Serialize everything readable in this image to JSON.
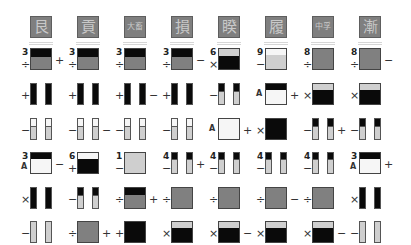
{
  "colors": {
    "background": "#ffffff",
    "tile": "#7f7f7f",
    "tile_glyph": "#c9c9c9",
    "black": "#0a0a0a",
    "gray": "#808080",
    "light": "#cfcfcf",
    "white": "#f6f6f6"
  },
  "columns_x": [
    30,
    77,
    124,
    171,
    218,
    265,
    312,
    359
  ],
  "rows_y": [
    48,
    83,
    118,
    152,
    187,
    221
  ],
  "headers": [
    "艮",
    "貢",
    "大畜",
    "損",
    "睽",
    "履",
    "中孚",
    "漸"
  ],
  "grid": [
    [
      {
        "type": "square",
        "top": "black",
        "topH": 8,
        "body": "gray",
        "num": "3",
        "pre": "÷",
        "post": "+"
      },
      {
        "type": "square",
        "top": "black",
        "topH": 8,
        "body": "gray",
        "num": "3",
        "pre": "÷",
        "post": ""
      },
      {
        "type": "square",
        "top": "black",
        "topH": 8,
        "body": "gray",
        "num": "3",
        "pre": "÷",
        "post": ""
      },
      {
        "type": "square",
        "top": "black",
        "topH": 8,
        "body": "gray",
        "num": "3",
        "pre": "÷",
        "post": "−"
      },
      {
        "type": "square",
        "top": "light",
        "topH": 7,
        "body": "black",
        "num": "6",
        "pre": "×",
        "post": ""
      },
      {
        "type": "square",
        "top": "white",
        "topH": 6,
        "body": "light",
        "num": "9",
        "pre": "−",
        "post": ""
      },
      {
        "type": "square",
        "top": "",
        "topH": 0,
        "body": "gray",
        "num": "8",
        "pre": "÷",
        "post": ""
      },
      {
        "type": "square",
        "top": "",
        "topH": 0,
        "body": "gray",
        "num": "8",
        "pre": "÷",
        "post": "−"
      }
    ],
    [
      {
        "type": "pills",
        "seg": "black",
        "segH": 22,
        "body": "black",
        "num": "",
        "pre": "+",
        "post": ""
      },
      {
        "type": "pills",
        "seg": "black",
        "segH": 22,
        "body": "black",
        "num": "",
        "pre": "+",
        "post": ""
      },
      {
        "type": "pills",
        "seg": "black",
        "segH": 22,
        "body": "black",
        "num": "",
        "pre": "+",
        "post": "−"
      },
      {
        "type": "pills",
        "seg": "black",
        "segH": 22,
        "body": "black",
        "num": "",
        "pre": "+",
        "post": ""
      },
      {
        "type": "pills",
        "seg": "black",
        "segH": 7,
        "body": "light",
        "num": "",
        "pre": "−",
        "post": ""
      },
      {
        "type": "square",
        "top": "black",
        "topH": 6,
        "body": "white",
        "num": "",
        "pre": "A",
        "post": "+"
      },
      {
        "type": "square",
        "top": "light",
        "topH": 6,
        "body": "black",
        "num": "",
        "pre": "×",
        "post": ""
      },
      {
        "type": "square",
        "top": "light",
        "topH": 6,
        "body": "black",
        "num": "",
        "pre": "×",
        "post": ""
      }
    ],
    [
      {
        "type": "pills",
        "seg": "white",
        "segH": 7,
        "body": "light",
        "num": "",
        "pre": "−",
        "post": ""
      },
      {
        "type": "pills",
        "seg": "white",
        "segH": 7,
        "body": "light",
        "num": "",
        "pre": "−",
        "post": "−"
      },
      {
        "type": "pills",
        "seg": "white",
        "segH": 7,
        "body": "light",
        "num": "",
        "pre": "−",
        "post": ""
      },
      {
        "type": "pills",
        "seg": "white",
        "segH": 7,
        "body": "light",
        "num": "",
        "pre": "−",
        "post": ""
      },
      {
        "type": "square",
        "top": "",
        "topH": 0,
        "body": "white",
        "num": "",
        "pre": "A",
        "post": "+"
      },
      {
        "type": "square",
        "top": "",
        "topH": 0,
        "body": "black",
        "num": "",
        "pre": "×",
        "post": ""
      },
      {
        "type": "pills",
        "seg": "black",
        "segH": 7,
        "body": "light",
        "num": "",
        "pre": "−",
        "post": "+"
      },
      {
        "type": "pills",
        "seg": "black",
        "segH": 7,
        "body": "light",
        "num": "",
        "pre": "−",
        "post": ""
      }
    ],
    [
      {
        "type": "square",
        "top": "black",
        "topH": 6,
        "body": "white",
        "num": "3",
        "pre": "A",
        "post": "−"
      },
      {
        "type": "square",
        "top": "white",
        "topH": 6,
        "body": "black",
        "num": "6",
        "pre": "+",
        "post": ""
      },
      {
        "type": "square",
        "top": "",
        "topH": 0,
        "body": "light",
        "num": "1",
        "pre": "−",
        "post": ""
      },
      {
        "type": "pills",
        "seg": "black",
        "segH": 6,
        "body": "light",
        "num": "4",
        "pre": "−",
        "post": "+"
      },
      {
        "type": "pills",
        "seg": "black",
        "segH": 6,
        "body": "light",
        "num": "4",
        "pre": "−",
        "post": ""
      },
      {
        "type": "pills",
        "seg": "black",
        "segH": 6,
        "body": "light",
        "num": "4",
        "pre": "−",
        "post": ""
      },
      {
        "type": "pills",
        "seg": "black",
        "segH": 6,
        "body": "light",
        "num": "4",
        "pre": "−",
        "post": ""
      },
      {
        "type": "square",
        "top": "black",
        "topH": 6,
        "body": "white",
        "num": "3",
        "pre": "A",
        "post": "+"
      }
    ],
    [
      {
        "type": "pills",
        "seg": "black",
        "segH": 22,
        "body": "black",
        "num": "",
        "pre": "×",
        "post": ""
      },
      {
        "type": "pills",
        "seg": "black",
        "segH": 7,
        "body": "light",
        "num": "",
        "pre": "−",
        "post": ""
      },
      {
        "type": "square",
        "top": "black",
        "topH": 7,
        "body": "gray",
        "num": "",
        "pre": "÷",
        "post": "+"
      },
      {
        "type": "square",
        "top": "",
        "topH": 0,
        "body": "gray",
        "num": "",
        "pre": "÷",
        "post": ""
      },
      {
        "type": "square",
        "top": "",
        "topH": 0,
        "body": "gray",
        "num": "",
        "pre": "÷",
        "post": ""
      },
      {
        "type": "square",
        "top": "",
        "topH": 0,
        "body": "gray",
        "num": "",
        "pre": "÷",
        "post": "−"
      },
      {
        "type": "square",
        "top": "",
        "topH": 0,
        "body": "gray",
        "num": "",
        "pre": "÷",
        "post": ""
      },
      {
        "type": "pills",
        "seg": "black",
        "segH": 22,
        "body": "black",
        "num": "",
        "pre": "×",
        "post": ""
      }
    ],
    [
      {
        "type": "pills",
        "seg": "light",
        "segH": 22,
        "body": "light",
        "num": "",
        "pre": "−",
        "post": ""
      },
      {
        "type": "square",
        "top": "",
        "topH": 0,
        "body": "gray",
        "num": "",
        "pre": "÷",
        "post": "+"
      },
      {
        "type": "square",
        "top": "",
        "topH": 0,
        "body": "black",
        "num": "",
        "pre": "+",
        "post": ""
      },
      {
        "type": "square",
        "top": "light",
        "topH": 6,
        "body": "black",
        "num": "",
        "pre": "×",
        "post": ""
      },
      {
        "type": "square",
        "top": "light",
        "topH": 6,
        "body": "black",
        "num": "",
        "pre": "×",
        "post": "−"
      },
      {
        "type": "square",
        "top": "light",
        "topH": 6,
        "body": "black",
        "num": "",
        "pre": "×",
        "post": ""
      },
      {
        "type": "square",
        "top": "light",
        "topH": 6,
        "body": "black",
        "num": "",
        "pre": "×",
        "post": "−"
      },
      {
        "type": "pills",
        "seg": "light",
        "segH": 22,
        "body": "light",
        "num": "",
        "pre": "−",
        "post": ""
      }
    ]
  ]
}
